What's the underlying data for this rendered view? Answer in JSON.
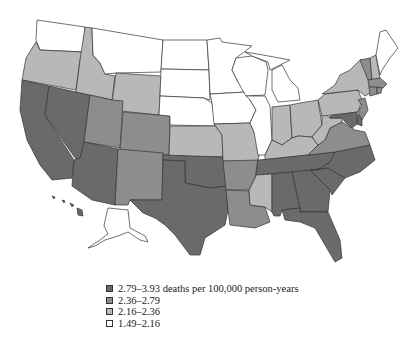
{
  "map": {
    "title": "",
    "colors": {
      "dark": "#6a6a6a",
      "medium": "#8d8d8d",
      "light": "#b8b8b8",
      "white": "#ffffff"
    },
    "states": {
      "WA": "white",
      "OR": "light",
      "CA": "dark",
      "NV": "dark",
      "ID": "light",
      "MT": "white",
      "WY": "light",
      "UT": "medium",
      "AZ": "dark",
      "CO": "medium",
      "NM": "medium",
      "ND": "white",
      "SD": "white",
      "NE": "white",
      "KS": "light",
      "OK": "dark",
      "TX": "dark",
      "MN": "white",
      "IA": "white",
      "MO": "light",
      "AR": "medium",
      "LA": "medium",
      "WI": "white",
      "IL": "white",
      "MI": "white",
      "IN": "light",
      "OH": "light",
      "KY": "light",
      "TN": "dark",
      "MS": "light",
      "AL": "dark",
      "GA": "dark",
      "FL": "dark",
      "SC": "dark",
      "NC": "dark",
      "VA": "medium",
      "WV": "light",
      "PA": "light",
      "NY": "light",
      "VT": "medium",
      "NH": "light",
      "ME": "white",
      "MA": "medium",
      "CT": "medium",
      "RI": "medium",
      "NJ": "medium",
      "DE": "dark",
      "MD": "dark",
      "AK": "white",
      "HI": "dark"
    }
  },
  "legend": {
    "items": [
      {
        "label": "2.79–3.93 deaths per 100,000 person-years",
        "class": "dark"
      },
      {
        "label": "2.36–2.79",
        "class": "medium"
      },
      {
        "label": "2.16–2.36",
        "class": "light"
      },
      {
        "label": "1.49–2.16",
        "class": "white"
      }
    ]
  }
}
